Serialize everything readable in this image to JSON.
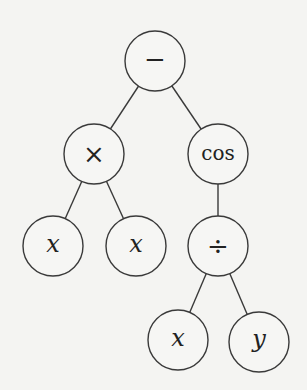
{
  "diagram": {
    "type": "expression-tree",
    "expression": "x*x - cos(x/y)",
    "nodes": [
      {
        "id": "root",
        "label": "−",
        "kind": "op",
        "cx": 155,
        "cy": 61
      },
      {
        "id": "times",
        "label": "×",
        "kind": "op",
        "cx": 94,
        "cy": 154
      },
      {
        "id": "cos",
        "label": "cos",
        "kind": "fn",
        "cx": 218,
        "cy": 154
      },
      {
        "id": "x1",
        "label": "x",
        "kind": "var",
        "cx": 53,
        "cy": 246
      },
      {
        "id": "x2",
        "label": "x",
        "kind": "var",
        "cx": 136,
        "cy": 246
      },
      {
        "id": "div",
        "label": "÷",
        "kind": "op",
        "cx": 218,
        "cy": 246
      },
      {
        "id": "x3",
        "label": "x",
        "kind": "var",
        "cx": 178,
        "cy": 340
      },
      {
        "id": "y",
        "label": "y",
        "kind": "var",
        "cx": 259,
        "cy": 342
      }
    ],
    "edges": [
      [
        "root",
        "times"
      ],
      [
        "root",
        "cos"
      ],
      [
        "times",
        "x1"
      ],
      [
        "times",
        "x2"
      ],
      [
        "cos",
        "div"
      ],
      [
        "div",
        "x3"
      ],
      [
        "div",
        "y"
      ]
    ],
    "radius": 30
  }
}
